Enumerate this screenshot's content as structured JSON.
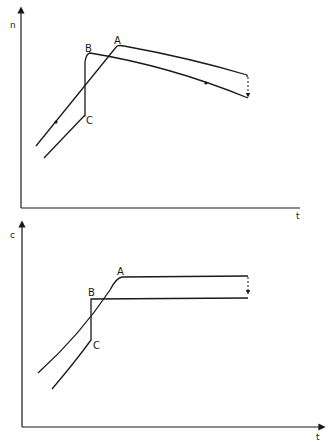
{
  "panels": [
    {
      "id": "top",
      "y_axis_label": "n",
      "x_axis_label": "t",
      "point_labels": {
        "A": "A",
        "B": "B",
        "C": "C"
      },
      "description": "n versus t; path rises to A then declines; alternate path jumps vertically C to B then declines; dashed drop at end"
    },
    {
      "id": "bottom",
      "y_axis_label": "c",
      "x_axis_label": "t",
      "point_labels": {
        "A": "A",
        "B": "B",
        "C": "C"
      },
      "description": "c versus t; path rises to A then flat; alternate path jumps vertically C to B then flat at lower level; dashed drop at end"
    }
  ]
}
